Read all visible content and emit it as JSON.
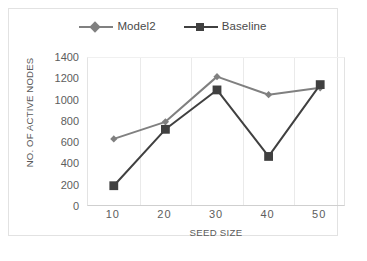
{
  "figure": {
    "background_color": "#ffffff",
    "frame_border_color": "#e2e2e2"
  },
  "chart_data": {
    "type": "line",
    "title": "",
    "xlabel": "SEED SIZE",
    "ylabel": "NO. OF ACTIVE NODES",
    "categories": [
      "10",
      "20",
      "30",
      "40",
      "50"
    ],
    "x": [
      10,
      20,
      30,
      40,
      50
    ],
    "series": [
      {
        "name": "Model2",
        "values": [
          640,
          800,
          1225,
          1055,
          1120
        ],
        "color": "#808080",
        "marker": "diamond"
      },
      {
        "name": "Baseline",
        "values": [
          200,
          730,
          1100,
          475,
          1150
        ],
        "color": "#404040",
        "marker": "square"
      }
    ],
    "ylim": [
      0,
      1400
    ],
    "yticks": [
      "0",
      "200",
      "400",
      "600",
      "800",
      "1000",
      "1200",
      "1400"
    ],
    "ytick_values": [
      0,
      200,
      400,
      600,
      800,
      1000,
      1200,
      1400
    ],
    "xticks": [
      "10",
      "20",
      "30",
      "40",
      "50"
    ],
    "grid": {
      "horizontal": false,
      "vertical": true,
      "color": "#eaeaea"
    },
    "legend": {
      "position": "top-center",
      "entries": [
        {
          "label": "Model2",
          "color": "#808080",
          "marker": "diamond"
        },
        {
          "label": "Baseline",
          "color": "#404040",
          "marker": "square"
        }
      ]
    }
  }
}
